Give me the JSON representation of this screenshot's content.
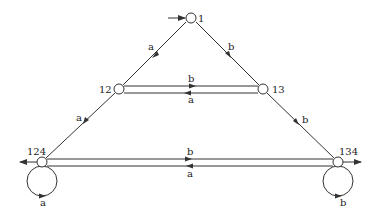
{
  "diagram": {
    "type": "automaton",
    "colors": {
      "stroke": "#333333",
      "node_fill": "#ffffff",
      "text": "#222222"
    },
    "states": [
      {
        "id": "s1",
        "label": "1",
        "x": 191,
        "y": 18,
        "initial": true,
        "final": false
      },
      {
        "id": "s12",
        "label": "12",
        "x": 119,
        "y": 89,
        "initial": false,
        "final": false
      },
      {
        "id": "s13",
        "label": "13",
        "x": 263,
        "y": 89,
        "initial": false,
        "final": false
      },
      {
        "id": "s124",
        "label": "124",
        "x": 42,
        "y": 162,
        "initial": false,
        "final": true
      },
      {
        "id": "s134",
        "label": "134",
        "x": 338,
        "y": 162,
        "initial": false,
        "final": true
      }
    ],
    "transitions": [
      {
        "from": "1",
        "to": "12",
        "symbol": "a"
      },
      {
        "from": "1",
        "to": "13",
        "symbol": "b"
      },
      {
        "from": "12",
        "to": "13",
        "symbol": "b"
      },
      {
        "from": "13",
        "to": "12",
        "symbol": "a"
      },
      {
        "from": "12",
        "to": "124",
        "symbol": "a"
      },
      {
        "from": "13",
        "to": "134",
        "symbol": "b"
      },
      {
        "from": "124",
        "to": "134",
        "symbol": "b"
      },
      {
        "from": "134",
        "to": "124",
        "symbol": "a"
      },
      {
        "from": "124",
        "to": "124",
        "symbol": "a"
      },
      {
        "from": "134",
        "to": "134",
        "symbol": "b"
      }
    ]
  }
}
